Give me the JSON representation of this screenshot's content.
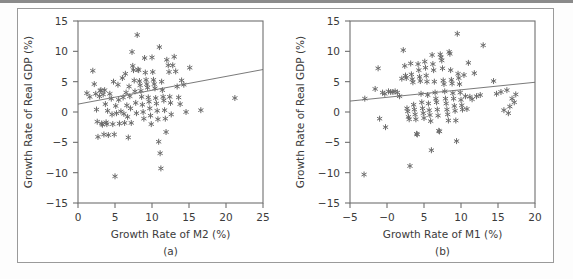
{
  "figure": {
    "background": "#ffffff",
    "frame_color": "#6f6f6f",
    "marker_color": "#6b6b6b",
    "line_color": "#6b6b6b"
  },
  "chart_data": [
    {
      "type": "scatter",
      "panel": "a",
      "caption": "(a)",
      "title": "",
      "xlabel": "Growth Rate of M2 (%)",
      "ylabel": "Growth Rate of Real GDP (%)",
      "xlim": [
        0,
        25
      ],
      "ylim": [
        -15,
        15
      ],
      "xticks": [
        0,
        5,
        10,
        15,
        20,
        25
      ],
      "xtick_labels": [
        "0",
        "5",
        "10",
        "15",
        "20",
        "25"
      ],
      "yticks": [
        15,
        10,
        5,
        0,
        -5,
        -10,
        -15
      ],
      "ytick_labels": [
        "15",
        "10",
        "5",
        "0",
        "-5",
        "-10",
        "-15"
      ],
      "grid": false,
      "legend": false,
      "marker": "asterisk",
      "fit_line": {
        "x0": 0,
        "y0": 1.3,
        "x1": 25,
        "y1": 7.0
      },
      "points": [
        [
          1.2,
          3.1
        ],
        [
          1.6,
          2.5
        ],
        [
          2.0,
          6.8
        ],
        [
          2.2,
          4.6
        ],
        [
          2.4,
          3.0
        ],
        [
          2.5,
          0.4
        ],
        [
          2.6,
          -1.6
        ],
        [
          2.7,
          -4.1
        ],
        [
          2.9,
          2.6
        ],
        [
          3.0,
          3.5
        ],
        [
          3.1,
          3.6
        ],
        [
          3.2,
          -1.9
        ],
        [
          3.3,
          -2.1
        ],
        [
          3.4,
          2.9
        ],
        [
          3.5,
          -3.7
        ],
        [
          3.6,
          3.6
        ],
        [
          3.7,
          1.3
        ],
        [
          3.8,
          -1.7
        ],
        [
          3.9,
          -2.0
        ],
        [
          4.0,
          0.2
        ],
        [
          4.1,
          -3.8
        ],
        [
          4.3,
          3.0
        ],
        [
          4.5,
          2.2
        ],
        [
          4.6,
          -0.4
        ],
        [
          4.7,
          -2.0
        ],
        [
          4.8,
          5.0
        ],
        [
          4.9,
          -3.7
        ],
        [
          5.0,
          -10.6
        ],
        [
          5.1,
          1.0
        ],
        [
          5.2,
          -0.2
        ],
        [
          5.4,
          4.5
        ],
        [
          5.5,
          2.0
        ],
        [
          5.6,
          -1.9
        ],
        [
          5.8,
          0.1
        ],
        [
          6.0,
          5.6
        ],
        [
          6.1,
          2.4
        ],
        [
          6.2,
          -0.3
        ],
        [
          6.3,
          -1.8
        ],
        [
          6.4,
          6.3
        ],
        [
          6.5,
          3.2
        ],
        [
          6.6,
          1.1
        ],
        [
          6.7,
          -0.8
        ],
        [
          6.8,
          -4.2
        ],
        [
          6.9,
          4.2
        ],
        [
          7.0,
          2.6
        ],
        [
          7.1,
          0.6
        ],
        [
          7.2,
          -1.8
        ],
        [
          7.3,
          9.9
        ],
        [
          7.4,
          7.6
        ],
        [
          7.5,
          6.9
        ],
        [
          7.6,
          5.2
        ],
        [
          7.7,
          3.4
        ],
        [
          7.8,
          1.5
        ],
        [
          7.9,
          -0.2
        ],
        [
          8.0,
          12.7
        ],
        [
          8.1,
          7.0
        ],
        [
          8.2,
          6.9
        ],
        [
          8.3,
          5.1
        ],
        [
          8.4,
          4.4
        ],
        [
          8.5,
          3.5
        ],
        [
          8.6,
          2.5
        ],
        [
          8.7,
          1.2
        ],
        [
          8.8,
          0.0
        ],
        [
          8.9,
          -1.1
        ],
        [
          9.0,
          8.9
        ],
        [
          9.1,
          6.5
        ],
        [
          9.2,
          5.3
        ],
        [
          9.3,
          4.6
        ],
        [
          9.4,
          4.0
        ],
        [
          9.5,
          2.4
        ],
        [
          9.6,
          1.7
        ],
        [
          9.7,
          0.6
        ],
        [
          9.8,
          -0.6
        ],
        [
          9.9,
          -2.0
        ],
        [
          10.0,
          9.0
        ],
        [
          10.1,
          6.6
        ],
        [
          10.2,
          5.3
        ],
        [
          10.3,
          4.6
        ],
        [
          10.4,
          3.9
        ],
        [
          10.5,
          2.3
        ],
        [
          10.6,
          1.4
        ],
        [
          10.7,
          0.2
        ],
        [
          10.8,
          -1.2
        ],
        [
          10.9,
          -4.9
        ],
        [
          11.0,
          10.7
        ],
        [
          11.1,
          -6.8
        ],
        [
          11.2,
          -9.3
        ],
        [
          11.3,
          5.0
        ],
        [
          11.4,
          3.6
        ],
        [
          11.5,
          2.5
        ],
        [
          11.6,
          1.9
        ],
        [
          11.7,
          0.3
        ],
        [
          11.8,
          -1.1
        ],
        [
          11.9,
          -3.3
        ],
        [
          12.0,
          8.6
        ],
        [
          12.2,
          7.7
        ],
        [
          12.3,
          6.6
        ],
        [
          12.4,
          2.5
        ],
        [
          12.5,
          1.5
        ],
        [
          12.6,
          -0.4
        ],
        [
          12.8,
          7.7
        ],
        [
          13.0,
          9.1
        ],
        [
          13.2,
          6.7
        ],
        [
          13.4,
          4.2
        ],
        [
          13.6,
          2.4
        ],
        [
          13.8,
          1.3
        ],
        [
          14.0,
          5.2
        ],
        [
          14.3,
          4.5
        ],
        [
          14.6,
          0.0
        ],
        [
          15.1,
          7.3
        ],
        [
          16.6,
          0.3
        ],
        [
          21.2,
          2.3
        ]
      ]
    },
    {
      "type": "scatter",
      "panel": "b",
      "caption": "(b)",
      "title": "",
      "xlabel": "Growth Rate of M1 (%)",
      "ylabel": "Growth Rate of Real GDP (%)",
      "xlim": [
        -5,
        20
      ],
      "ylim": [
        -15,
        15
      ],
      "xticks": [
        -5,
        0,
        5,
        10,
        15,
        20
      ],
      "xtick_labels": [
        "-5",
        "-0",
        "5",
        "10",
        "15",
        "20"
      ],
      "yticks": [
        15,
        10,
        5,
        0,
        -5,
        -10,
        -15
      ],
      "ytick_labels": [
        "15",
        "10",
        "5",
        "0",
        "-5",
        "-10",
        "-15"
      ],
      "grid": false,
      "legend": false,
      "marker": "asterisk",
      "fit_line": {
        "x0": -5,
        "y0": 1.8,
        "x1": 20,
        "y1": 4.9
      },
      "points": [
        [
          -3.1,
          -10.3
        ],
        [
          -3.0,
          2.2
        ],
        [
          -1.6,
          3.8
        ],
        [
          -1.2,
          7.2
        ],
        [
          -1.0,
          -1.1
        ],
        [
          -0.6,
          3.2
        ],
        [
          -0.3,
          3.0
        ],
        [
          -0.2,
          -2.5
        ],
        [
          0.2,
          3.4
        ],
        [
          0.5,
          3.3
        ],
        [
          0.8,
          3.3
        ],
        [
          1.1,
          3.4
        ],
        [
          1.4,
          3.2
        ],
        [
          1.7,
          2.6
        ],
        [
          2.0,
          5.5
        ],
        [
          2.2,
          10.2
        ],
        [
          2.4,
          7.6
        ],
        [
          2.5,
          6.0
        ],
        [
          2.6,
          5.6
        ],
        [
          2.7,
          0.6
        ],
        [
          2.8,
          0.1
        ],
        [
          2.9,
          -0.8
        ],
        [
          3.0,
          -1.2
        ],
        [
          3.1,
          -8.9
        ],
        [
          3.2,
          8.0
        ],
        [
          3.3,
          6.2
        ],
        [
          3.4,
          5.4
        ],
        [
          3.5,
          4.9
        ],
        [
          3.6,
          1.2
        ],
        [
          3.7,
          0.4
        ],
        [
          3.8,
          -0.4
        ],
        [
          3.9,
          -1.2
        ],
        [
          4.0,
          -3.6
        ],
        [
          4.1,
          -3.7
        ],
        [
          4.2,
          7.9
        ],
        [
          4.3,
          6.9
        ],
        [
          4.4,
          5.8
        ],
        [
          4.5,
          5.1
        ],
        [
          4.6,
          3.0
        ],
        [
          4.7,
          1.6
        ],
        [
          4.8,
          0.6
        ],
        [
          4.9,
          -0.2
        ],
        [
          5.0,
          -1.0
        ],
        [
          5.1,
          8.3
        ],
        [
          5.2,
          7.3
        ],
        [
          5.3,
          6.0
        ],
        [
          5.4,
          5.0
        ],
        [
          5.5,
          2.8
        ],
        [
          5.6,
          1.4
        ],
        [
          5.7,
          0.3
        ],
        [
          5.8,
          -0.5
        ],
        [
          5.9,
          -1.5
        ],
        [
          6.0,
          -6.3
        ],
        [
          6.1,
          9.4
        ],
        [
          6.2,
          7.9
        ],
        [
          6.3,
          6.9
        ],
        [
          6.4,
          5.0
        ],
        [
          6.5,
          3.2
        ],
        [
          6.6,
          2.2
        ],
        [
          6.7,
          1.6
        ],
        [
          6.8,
          0.4
        ],
        [
          6.9,
          -0.6
        ],
        [
          7.0,
          -3.1
        ],
        [
          7.1,
          -3.2
        ],
        [
          7.2,
          9.5
        ],
        [
          7.3,
          9.0
        ],
        [
          7.4,
          8.5
        ],
        [
          7.5,
          7.2
        ],
        [
          7.6,
          5.2
        ],
        [
          7.7,
          4.6
        ],
        [
          7.8,
          3.4
        ],
        [
          7.9,
          2.2
        ],
        [
          8.0,
          1.4
        ],
        [
          8.1,
          0.4
        ],
        [
          8.2,
          -0.4
        ],
        [
          8.3,
          -1.4
        ],
        [
          8.4,
          9.9
        ],
        [
          8.5,
          9.6
        ],
        [
          8.6,
          6.9
        ],
        [
          8.7,
          5.3
        ],
        [
          8.8,
          4.7
        ],
        [
          8.9,
          3.1
        ],
        [
          9.0,
          2.2
        ],
        [
          9.1,
          1.0
        ],
        [
          9.2,
          0.2
        ],
        [
          9.3,
          -1.4
        ],
        [
          9.4,
          -4.8
        ],
        [
          9.5,
          12.9
        ],
        [
          9.6,
          6.3
        ],
        [
          9.7,
          5.6
        ],
        [
          9.8,
          4.6
        ],
        [
          9.9,
          3.2
        ],
        [
          10.0,
          2.0
        ],
        [
          10.1,
          1.1
        ],
        [
          10.2,
          0.4
        ],
        [
          10.4,
          6.1
        ],
        [
          10.6,
          2.6
        ],
        [
          10.8,
          0.5
        ],
        [
          11.0,
          8.1
        ],
        [
          11.2,
          2.5
        ],
        [
          11.5,
          2.1
        ],
        [
          11.8,
          6.4
        ],
        [
          12.1,
          2.6
        ],
        [
          12.6,
          2.8
        ],
        [
          13.0,
          11.0
        ],
        [
          14.4,
          5.1
        ],
        [
          14.8,
          3.0
        ],
        [
          15.4,
          3.3
        ],
        [
          15.8,
          0.3
        ],
        [
          16.2,
          3.6
        ],
        [
          16.4,
          -0.2
        ],
        [
          16.6,
          0.9
        ],
        [
          16.9,
          2.2
        ],
        [
          17.2,
          1.6
        ],
        [
          17.4,
          2.9
        ]
      ]
    }
  ]
}
